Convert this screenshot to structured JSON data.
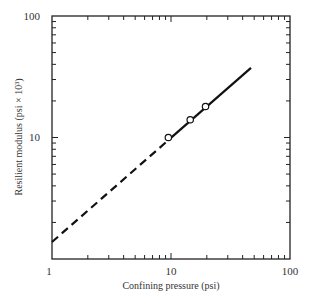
{
  "chart_data": {
    "type": "line",
    "title": "",
    "xlabel": "Confining pressure (psi)",
    "ylabel": "Resilient modulus (psi × 10³)",
    "xscale": "log",
    "yscale": "log",
    "xlim": [
      1,
      100
    ],
    "ylim": [
      1,
      100
    ],
    "x_tick_labels": [
      "1",
      "10",
      "100"
    ],
    "y_tick_labels": [
      "10",
      "100"
    ],
    "grid": false,
    "legend": null,
    "series": [
      {
        "name": "Measured data",
        "style": "open-circle markers",
        "x": [
          9.5,
          14.5,
          19.5
        ],
        "y": [
          10,
          14,
          18
        ]
      },
      {
        "name": "Fitted line (solid)",
        "style": "solid",
        "x": [
          9.5,
          47
        ],
        "y": [
          9.5,
          37.5
        ]
      },
      {
        "name": "Extrapolation (dashed)",
        "style": "dashed",
        "x": [
          1,
          9.5
        ],
        "y": [
          1.38,
          9.5
        ]
      }
    ]
  },
  "labels": {
    "x_axis": "Confining pressure (psi)",
    "y_axis": "Resilient modulus (psi × 10³)",
    "x_ticks": {
      "t1": "1",
      "t10": "10",
      "t100": "100"
    },
    "y_ticks": {
      "t10": "10",
      "t100": "100"
    }
  }
}
